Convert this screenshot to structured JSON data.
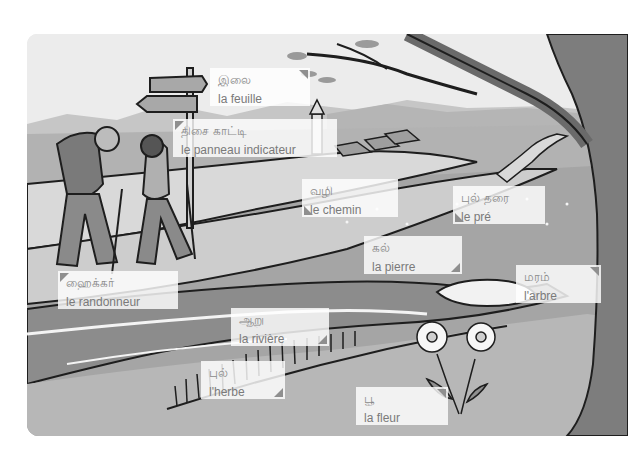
{
  "scene": {
    "description": "Vocabulary illustration: hikers on a countryside path",
    "colors": {
      "sky": "#ececec",
      "mountains": "#c4c4c4",
      "meadow": "#a9a9a9",
      "path": "#d6d6d6",
      "river": "#8c8c8c",
      "tree": "#7d7d7d",
      "outline": "#1e1e1e",
      "label_bg": "#ffffff",
      "label_text": "#7a7a7a",
      "corner_marker": "#8f8f8f"
    }
  },
  "labels": [
    {
      "id": "leaf",
      "tamil": "இலை",
      "french": "la feuille",
      "corner": "tr"
    },
    {
      "id": "signpost",
      "tamil": "திசை காட்டி",
      "french": "le panneau indicateur",
      "corner": "tl"
    },
    {
      "id": "path",
      "tamil": "வழி",
      "french": "le chemin",
      "corner": "bl"
    },
    {
      "id": "meadow",
      "tamil": "புல் தரை",
      "french": "le pré",
      "corner": "bl"
    },
    {
      "id": "stone",
      "tamil": "கல்",
      "french": "la pierre",
      "corner": "br"
    },
    {
      "id": "tree",
      "tamil": "மரம்",
      "french": "l'arbre",
      "corner": "tr"
    },
    {
      "id": "hiker",
      "tamil": "ஹைக்கர்",
      "french": "le randonneur",
      "corner": "tl"
    },
    {
      "id": "river",
      "tamil": "ஆறு",
      "french": "la rivière",
      "corner": "br"
    },
    {
      "id": "grass",
      "tamil": "புல்",
      "french": "l'herbe",
      "corner": "br"
    },
    {
      "id": "flower",
      "tamil": "பூ",
      "french": "la fleur",
      "corner": "tr"
    }
  ]
}
